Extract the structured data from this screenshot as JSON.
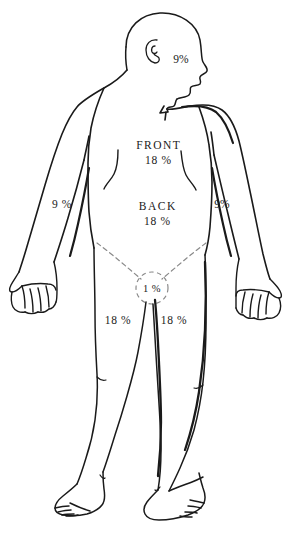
{
  "diagram": {
    "line_color": "#1a1a1a",
    "background_color": "#ffffff",
    "dashed_color": "#8a8a8a"
  },
  "labels": {
    "head": {
      "name": "head",
      "value": "9%"
    },
    "front_torso": {
      "name": "front-torso",
      "region": "FRONT",
      "value": "18 %"
    },
    "back_torso": {
      "name": "back-torso",
      "region": "BACK",
      "value": "18 %"
    },
    "left_arm": {
      "name": "left-arm",
      "value": "9 %"
    },
    "right_arm": {
      "name": "right-arm",
      "value": "9%"
    },
    "groin": {
      "name": "groin",
      "value": "1 %"
    },
    "left_leg": {
      "name": "left-leg",
      "value": "18 %"
    },
    "right_leg": {
      "name": "right-leg",
      "value": "18 %"
    }
  }
}
